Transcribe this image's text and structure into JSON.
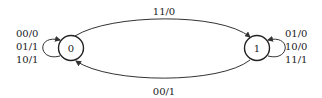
{
  "diagram": {
    "type": "state-machine",
    "states": [
      {
        "id": "0",
        "label": "0"
      },
      {
        "id": "1",
        "label": "1"
      }
    ],
    "transitions": [
      {
        "from": "0",
        "to": "1",
        "label": "11/0"
      },
      {
        "from": "1",
        "to": "0",
        "label": "00/1"
      },
      {
        "from": "0",
        "to": "0",
        "labels": [
          "00/0",
          "01/1",
          "10/1"
        ]
      },
      {
        "from": "1",
        "to": "1",
        "labels": [
          "01/0",
          "10/0",
          "11/1"
        ]
      }
    ]
  }
}
